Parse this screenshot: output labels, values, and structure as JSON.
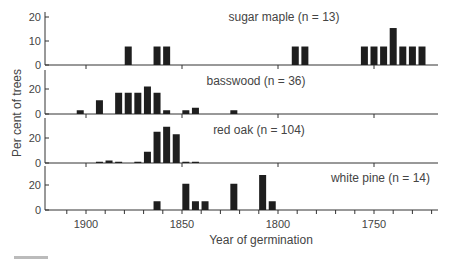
{
  "chart_data": {
    "type": "bar",
    "title": "",
    "xlabel": "Year of germination",
    "ylabel": "Per cent of trees",
    "x_axis": {
      "reversed": true,
      "range": [
        1880,
        1715
      ],
      "ticks": [
        1900,
        1850,
        1800,
        1750
      ],
      "minor_tick_step": 10
    },
    "grid": false,
    "panels": [
      {
        "name": "sugar maple",
        "label": "sugar maple (n = 13)",
        "yticks": [
          0,
          10,
          20
        ],
        "ylim": [
          0,
          22
        ],
        "bars": [
          {
            "year": 1878,
            "value": 7.7
          },
          {
            "year": 1863,
            "value": 7.7
          },
          {
            "year": 1858,
            "value": 7.7
          },
          {
            "year": 1791,
            "value": 7.7
          },
          {
            "year": 1786,
            "value": 7.7
          },
          {
            "year": 1755,
            "value": 7.7
          },
          {
            "year": 1750,
            "value": 7.7
          },
          {
            "year": 1745,
            "value": 7.7
          },
          {
            "year": 1740,
            "value": 15.4
          },
          {
            "year": 1735,
            "value": 7.7
          },
          {
            "year": 1730,
            "value": 7.7
          },
          {
            "year": 1725,
            "value": 7.7
          }
        ]
      },
      {
        "name": "basswood",
        "label": "basswood (n = 36)",
        "yticks": [
          0,
          20
        ],
        "ylim": [
          0,
          30
        ],
        "bars": [
          {
            "year": 1903,
            "value": 3
          },
          {
            "year": 1893,
            "value": 11
          },
          {
            "year": 1883,
            "value": 17
          },
          {
            "year": 1878,
            "value": 17
          },
          {
            "year": 1873,
            "value": 17
          },
          {
            "year": 1868,
            "value": 22
          },
          {
            "year": 1863,
            "value": 17
          },
          {
            "year": 1858,
            "value": 3
          },
          {
            "year": 1848,
            "value": 3
          },
          {
            "year": 1843,
            "value": 5
          },
          {
            "year": 1823,
            "value": 3
          }
        ]
      },
      {
        "name": "red oak",
        "label": "red oak (n = 104)",
        "yticks": [
          0,
          20
        ],
        "ylim": [
          0,
          30
        ],
        "bars": [
          {
            "year": 1893,
            "value": 1
          },
          {
            "year": 1888,
            "value": 2
          },
          {
            "year": 1883,
            "value": 1
          },
          {
            "year": 1873,
            "value": 1
          },
          {
            "year": 1868,
            "value": 9
          },
          {
            "year": 1863,
            "value": 25
          },
          {
            "year": 1858,
            "value": 29
          },
          {
            "year": 1853,
            "value": 23
          },
          {
            "year": 1848,
            "value": 1
          },
          {
            "year": 1843,
            "value": 1
          }
        ]
      },
      {
        "name": "white pine",
        "label": "white pine (n = 14)",
        "yticks": [
          0,
          20
        ],
        "ylim": [
          0,
          30
        ],
        "bars": [
          {
            "year": 1863,
            "value": 7
          },
          {
            "year": 1848,
            "value": 21
          },
          {
            "year": 1843,
            "value": 7
          },
          {
            "year": 1838,
            "value": 7
          },
          {
            "year": 1823,
            "value": 21
          },
          {
            "year": 1808,
            "value": 28
          },
          {
            "year": 1803,
            "value": 7
          }
        ]
      }
    ]
  }
}
